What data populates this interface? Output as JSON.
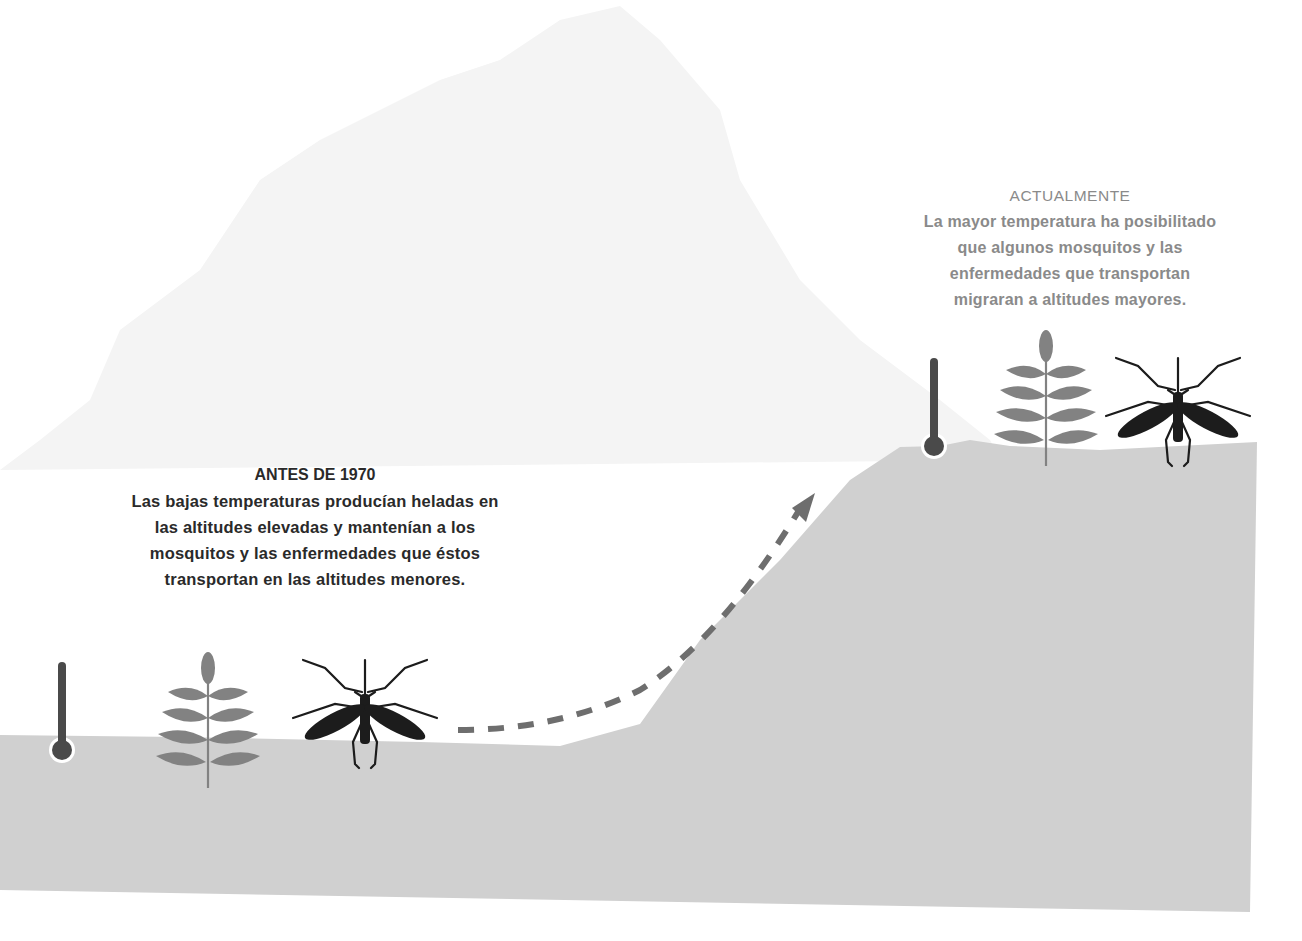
{
  "colors": {
    "background": "#ffffff",
    "mountain": "#f4f4f4",
    "ground": "#d0d0d0",
    "plant": "#828282",
    "mosquito": "#1c1c1c",
    "thermometer": "#4a4a4a",
    "arrow": "#6e6e6e",
    "caption_dark": "#2a2a2a",
    "caption_light": "#8a8a8a"
  },
  "captions": {
    "before": {
      "title": "ANTES DE 1970",
      "lines": [
        "Las bajas temperaturas producían heladas en",
        "las altitudes elevadas y mantenían a los",
        "mosquitos y las enfermedades que éstos",
        "transportan en las altitudes menores."
      ]
    },
    "now": {
      "title": "ACTUALMENTE",
      "lines": [
        "La mayor temperatura ha posibilitado",
        "que algunos mosquitos y las",
        "enfermedades que transportan",
        "migraran a altitudes mayores."
      ]
    }
  },
  "icons": {
    "low_altitude": [
      "thermometer-icon",
      "plant-icon",
      "mosquito-icon"
    ],
    "high_altitude": [
      "thermometer-icon",
      "plant-icon",
      "mosquito-icon"
    ],
    "migration": "dashed-arrow-icon"
  }
}
